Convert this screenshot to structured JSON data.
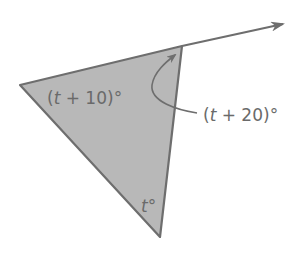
{
  "diagram": {
    "type": "triangle-exterior-angle",
    "colors": {
      "fill": "#b8b8b8",
      "stroke": "#6e6e6e",
      "text": "#6a6a6a",
      "background": "#ffffff"
    },
    "vertices": {
      "left": [
        20,
        85
      ],
      "top_right": [
        182,
        46
      ],
      "bottom": [
        160,
        237
      ]
    },
    "ray_end": [
      283,
      24
    ],
    "labels": {
      "left_angle": {
        "open": "(",
        "var": "t",
        "rest": " + 10)°"
      },
      "exterior_angle": {
        "open": "(",
        "var": "t",
        "rest": " + 20)°"
      },
      "bottom_angle": {
        "var": "t",
        "rest": "°"
      }
    }
  }
}
